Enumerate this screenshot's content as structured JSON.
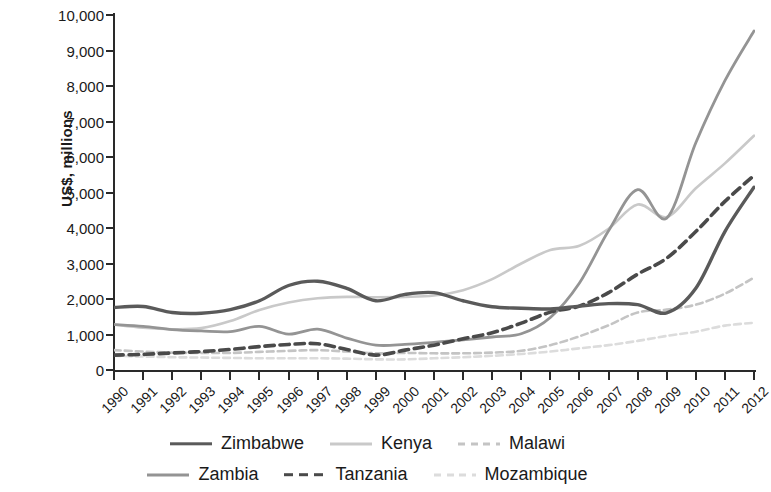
{
  "chart_data": {
    "type": "line",
    "title": "",
    "xlabel": "",
    "ylabel": "US$, millions",
    "ylim": [
      0,
      10000
    ],
    "ytick_values": [
      0,
      1000,
      2000,
      3000,
      4000,
      5000,
      6000,
      7000,
      8000,
      9000,
      10000
    ],
    "ytick_labels": [
      "0",
      "1,000",
      "2,000",
      "3,000",
      "4,000",
      "5,000",
      "6,000",
      "7,000",
      "8,000",
      "9,000",
      "10,000"
    ],
    "grid": false,
    "legend_position": "bottom",
    "x": [
      1990,
      1991,
      1992,
      1993,
      1994,
      1995,
      1996,
      1997,
      1998,
      1999,
      2000,
      2001,
      2002,
      2003,
      2004,
      2005,
      2006,
      2007,
      2008,
      2009,
      2010,
      2011,
      2012
    ],
    "xtick_labels": [
      "1990",
      "1991",
      "1992",
      "1993",
      "1994",
      "1995",
      "1996",
      "1997",
      "1998",
      "1999",
      "2000",
      "2001",
      "2002",
      "2003",
      "2004",
      "2005",
      "2006",
      "2007",
      "2008",
      "2009",
      "2010",
      "2011",
      "2012"
    ],
    "series": [
      {
        "name": "Zimbabwe",
        "color": "#5a5a5a",
        "style": "solid",
        "width": 3.4,
        "values": [
          1760,
          1790,
          1620,
          1600,
          1700,
          1950,
          2380,
          2500,
          2300,
          1950,
          2130,
          2180,
          1950,
          1780,
          1740,
          1720,
          1800,
          1870,
          1840,
          1610,
          2300,
          3900,
          5150
        ]
      },
      {
        "name": "Kenya",
        "color": "#c9c9c9",
        "style": "solid",
        "width": 2.6,
        "values": [
          1280,
          1190,
          1150,
          1180,
          1380,
          1690,
          1900,
          2020,
          2060,
          2050,
          2060,
          2100,
          2250,
          2560,
          3000,
          3380,
          3500,
          3980,
          4660,
          4310,
          5120,
          5820,
          6600
        ]
      },
      {
        "name": "Malawi",
        "color": "#c4c4c4",
        "style": "dashed",
        "width": 2.6,
        "values": [
          560,
          520,
          490,
          480,
          480,
          510,
          540,
          560,
          520,
          470,
          480,
          470,
          470,
          490,
          540,
          700,
          950,
          1260,
          1620,
          1700,
          1840,
          2150,
          2600
        ]
      },
      {
        "name": "Zambia",
        "color": "#949494",
        "style": "solid",
        "width": 2.8,
        "values": [
          1280,
          1230,
          1140,
          1100,
          1080,
          1230,
          1010,
          1150,
          900,
          700,
          720,
          780,
          850,
          930,
          1020,
          1480,
          2450,
          3920,
          5080,
          4280,
          6400,
          8150,
          9550
        ]
      },
      {
        "name": "Tanzania",
        "color": "#4a4a4a",
        "style": "dashed",
        "width": 3.6,
        "values": [
          420,
          440,
          480,
          520,
          580,
          660,
          720,
          740,
          580,
          420,
          560,
          700,
          880,
          1050,
          1320,
          1630,
          1800,
          2180,
          2700,
          3150,
          3900,
          4750,
          5480
        ]
      },
      {
        "name": "Mozambique",
        "color": "#dcdcdc",
        "style": "dashed",
        "width": 2.6,
        "values": [
          400,
          380,
          360,
          350,
          340,
          330,
          330,
          330,
          320,
          300,
          300,
          330,
          360,
          400,
          450,
          520,
          610,
          700,
          820,
          960,
          1080,
          1250,
          1330
        ]
      }
    ]
  },
  "legend": {
    "rows": [
      [
        {
          "label": "Zimbabwe",
          "series": "Zimbabwe"
        },
        {
          "label": "Kenya",
          "series": "Kenya"
        },
        {
          "label": "Malawi",
          "series": "Malawi"
        }
      ],
      [
        {
          "label": "Zambia",
          "series": "Zambia"
        },
        {
          "label": "Tanzania",
          "series": "Tanzania"
        },
        {
          "label": "Mozambique",
          "series": "Mozambique"
        }
      ]
    ]
  }
}
